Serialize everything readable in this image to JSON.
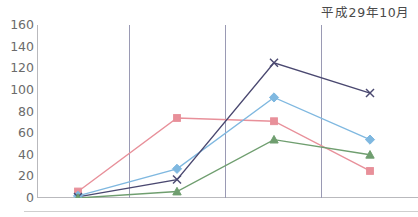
{
  "chart": {
    "title": "平成29年10月"
  },
  "chart_data": {
    "type": "line",
    "title": "平成29年10月",
    "xlabel": "",
    "ylabel": "",
    "ylim": [
      0,
      160
    ],
    "ytick_values": [
      0,
      20,
      40,
      60,
      80,
      100,
      120,
      140,
      160
    ],
    "ytick_labels": [
      "0",
      "20",
      "40",
      "60",
      "80",
      "100",
      "120",
      "140",
      "160"
    ],
    "grid": "vertical",
    "vertical_gridline_x_indices": [
      1,
      2,
      3
    ],
    "legend": "none",
    "x": [
      1,
      2,
      3,
      4
    ],
    "categories": [
      "1",
      "2",
      "3",
      "4"
    ],
    "series": [
      {
        "name": "series-pink",
        "marker": "square",
        "color": "#e8909a",
        "values": [
          6,
          74,
          71,
          25
        ]
      },
      {
        "name": "series-blue",
        "marker": "diamond",
        "color": "#7fb8e0",
        "values": [
          2,
          27,
          93,
          54
        ]
      },
      {
        "name": "series-navy",
        "marker": "x",
        "color": "#4a4870",
        "values": [
          1,
          17,
          125,
          97
        ]
      },
      {
        "name": "series-green",
        "marker": "triangle",
        "color": "#6f9e6f",
        "values": [
          0,
          6,
          54,
          40
        ]
      }
    ]
  }
}
